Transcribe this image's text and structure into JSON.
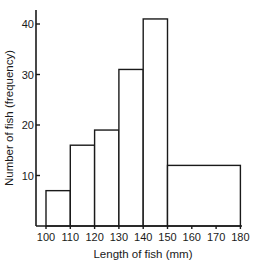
{
  "chart_data": {
    "type": "bar",
    "subtype": "histogram",
    "title": "",
    "xlabel": "Length of fish (mm)",
    "ylabel": "Number of fish (frequency)",
    "bins": [
      {
        "from": 100,
        "to": 110,
        "value": 7
      },
      {
        "from": 110,
        "to": 120,
        "value": 16
      },
      {
        "from": 120,
        "to": 130,
        "value": 19
      },
      {
        "from": 130,
        "to": 140,
        "value": 31
      },
      {
        "from": 140,
        "to": 150,
        "value": 41
      },
      {
        "from": 150,
        "to": 180,
        "value": 12
      }
    ],
    "categories": [
      "100-110",
      "110-120",
      "120-130",
      "130-140",
      "140-150",
      "150-180"
    ],
    "values": [
      7,
      16,
      19,
      31,
      41,
      12
    ],
    "x_ticks": [
      100,
      110,
      120,
      130,
      140,
      150,
      160,
      170,
      180
    ],
    "y_ticks": [
      10,
      20,
      30,
      40
    ],
    "xlim": [
      100,
      180
    ],
    "ylim": [
      0,
      44
    ],
    "grid": false,
    "legend": null
  }
}
